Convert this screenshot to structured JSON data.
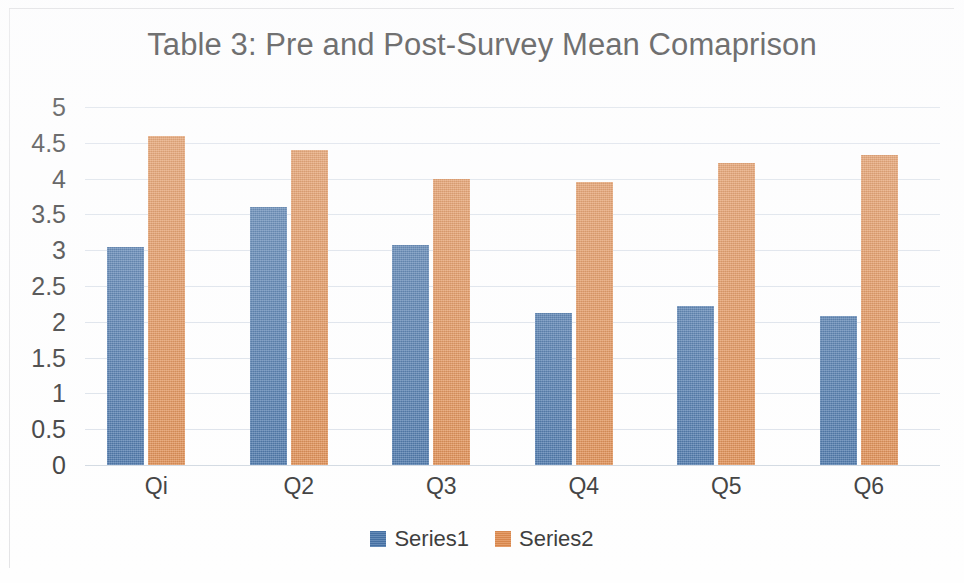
{
  "chart_data": {
    "type": "bar",
    "title": "Table 3: Pre and Post-Survey Mean Comaprison",
    "xlabel": "",
    "ylabel": "",
    "categories": [
      "Qi",
      "Q2",
      "Q3",
      "Q4",
      "Q5",
      "Q6"
    ],
    "series": [
      {
        "name": "Series1",
        "color": "#4472a8",
        "values": [
          3.05,
          3.6,
          3.07,
          2.12,
          2.22,
          2.08
        ]
      },
      {
        "name": "Series2",
        "color": "#e08a4c",
        "values": [
          4.59,
          4.4,
          4.0,
          3.95,
          4.22,
          4.33
        ]
      }
    ],
    "ylim": [
      0,
      5
    ],
    "ytick_step": 0.5,
    "ytick_labels": [
      "5",
      "4.5",
      "4",
      "3.5",
      "3",
      "2.5",
      "2",
      "1.5",
      "1",
      "0.5",
      "0"
    ],
    "grid": true,
    "grid_color": "#d6dde6",
    "legend_position": "bottom"
  }
}
